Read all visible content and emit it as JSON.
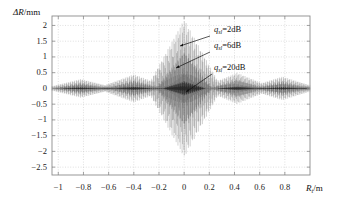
{
  "chart_data": {
    "type": "line",
    "title": "",
    "xlabel": "R_t/m",
    "ylabel": "ΔR/mm",
    "xlabel_main": "R",
    "xlabel_sub": "t",
    "xlabel_unit": "/m",
    "ylabel_text": "ΔR/mm",
    "xlim": [
      -1.05,
      1.0
    ],
    "ylim": [
      -2.75,
      2.3
    ],
    "xticks": [
      -1,
      -0.8,
      -0.6,
      -0.4,
      -0.2,
      0,
      0.2,
      0.4,
      0.6,
      0.8
    ],
    "xticklabels": [
      "−1",
      "−0.8",
      "−0.6",
      "−0.4",
      "−0.2",
      "0",
      "0.2",
      "0.4",
      "0.6",
      "0.8"
    ],
    "yticks": [
      2,
      1.5,
      1,
      0.5,
      0,
      -0.5,
      -1,
      -1.5,
      -2,
      -2.5
    ],
    "yticklabels": [
      "2",
      "1.5",
      "1",
      "0.5",
      "0",
      "−0.5",
      "−1",
      "−1.5",
      "−2",
      "−2.5"
    ],
    "grid": true,
    "grid_style": "dotted",
    "legend_position": "inline-annotations",
    "series": [
      {
        "name": "q_sl=2dB",
        "label": "q_{sl}=2dB",
        "color": "#2b2b2b",
        "peak_amplitude": 2.2,
        "envelope_type": "oscillatory-burst",
        "main_lobe_half_width": 0.3,
        "sidelobe_peaks": [
          {
            "x": -0.82,
            "amplitude": 0.3
          },
          {
            "x": -0.62,
            "amplitude": 0.1
          },
          {
            "x": -0.4,
            "amplitude": 0.45
          },
          {
            "x": -0.2,
            "amplitude": 0.08
          },
          {
            "x": 0.0,
            "amplitude": 2.2
          },
          {
            "x": 0.42,
            "amplitude": 0.5
          },
          {
            "x": 0.62,
            "amplitude": 0.12
          },
          {
            "x": 0.78,
            "amplitude": 0.38
          },
          {
            "x": 0.95,
            "amplitude": 0.12
          }
        ]
      },
      {
        "name": "q_sl=6dB",
        "label": "q_{sl}=6dB",
        "color": "#3d3d3d",
        "peak_amplitude": 1.2,
        "envelope_type": "oscillatory-burst",
        "main_lobe_half_width": 0.22
      },
      {
        "name": "q_sl=20dB",
        "label": "q_{sl}=20dB",
        "color": "#0d0d0d",
        "peak_amplitude": 0.22,
        "envelope_type": "oscillatory-burst",
        "main_lobe_half_width": 0.16
      }
    ],
    "annotations": [
      {
        "id": "ann-2db",
        "text_main": "q",
        "text_sub": "sl",
        "text_rest": "=2dB",
        "text": "q_sl=2dB",
        "label_x_px": 214,
        "label_y_px": 30,
        "arrow_from_px": [
          210,
          36
        ],
        "arrow_to_px": [
          180,
          46
        ]
      },
      {
        "id": "ann-6db",
        "text_main": "q",
        "text_sub": "sl",
        "text_rest": "=6dB",
        "text": "q_sl=6dB",
        "label_x_px": 214,
        "label_y_px": 46,
        "arrow_from_px": [
          210,
          52
        ],
        "arrow_to_px": [
          176,
          68
        ]
      },
      {
        "id": "ann-20db",
        "text_main": "q",
        "text_sub": "sl",
        "text_rest": "=20dB",
        "text": "q_sl=20dB",
        "label_x_px": 214,
        "label_y_px": 68,
        "arrow_from_px": [
          212,
          74
        ],
        "arrow_to_px": [
          186,
          92
        ]
      }
    ]
  },
  "figure": {
    "background": "#ffffff",
    "axis_color": "#8c8c8c",
    "grid_color": "#bfbfbf",
    "trace_color": "#2b2b2b"
  }
}
